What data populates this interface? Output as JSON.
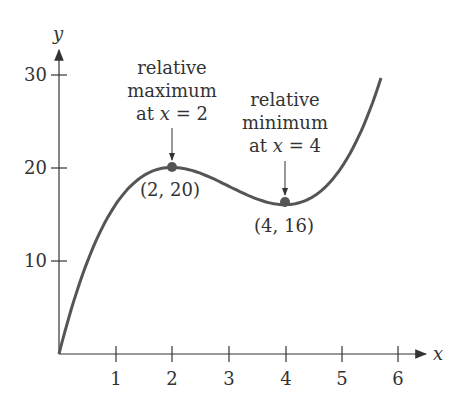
{
  "chart_data": {
    "type": "line",
    "function": "f(x) = x^3 - 9x^2 + 24x",
    "xlabel": "x",
    "ylabel": "y",
    "x_ticks": [
      1,
      2,
      3,
      4,
      5,
      6
    ],
    "y_ticks": [
      10,
      20,
      30
    ],
    "xlim": [
      0,
      6.5
    ],
    "ylim": [
      0,
      31
    ],
    "grid": false,
    "series": [
      {
        "name": "f",
        "x": [
          0,
          0.5,
          1,
          1.5,
          2,
          2.5,
          3,
          3.5,
          4,
          4.5,
          5,
          5.5,
          5.7
        ],
        "y": [
          0,
          9.875,
          16,
          19.125,
          20,
          19.375,
          18,
          16.625,
          16,
          16.875,
          20,
          26.125,
          29.6
        ]
      }
    ],
    "points": [
      {
        "x": 2,
        "y": 20,
        "label": "(2, 20)"
      },
      {
        "x": 4,
        "y": 16,
        "label": "(4, 16)"
      }
    ],
    "annotations": [
      {
        "lines": [
          "relative",
          "maximum",
          "at x = 2"
        ],
        "target": [
          2,
          20
        ]
      },
      {
        "lines": [
          "relative",
          "minimum",
          "at x = 4"
        ],
        "target": [
          4,
          16
        ]
      }
    ]
  },
  "axis": {
    "x_label": "x",
    "y_label": "y",
    "x_ticks": [
      "1",
      "2",
      "3",
      "4",
      "5",
      "6"
    ],
    "y_ticks": [
      "10",
      "20",
      "30"
    ]
  },
  "labels": {
    "max_line1": "relative",
    "max_line2": "maximum",
    "max_line3_pre": "at ",
    "max_line3_var": "x",
    "max_line3_post": " = 2",
    "min_line1": "relative",
    "min_line2": "minimum",
    "min_line3_pre": "at ",
    "min_line3_var": "x",
    "min_line3_post": " = 4",
    "max_point": "(2, 20)",
    "min_point": "(4, 16)"
  },
  "colors": {
    "curve": "#555555",
    "axis": "#333333",
    "point": "#555555"
  }
}
